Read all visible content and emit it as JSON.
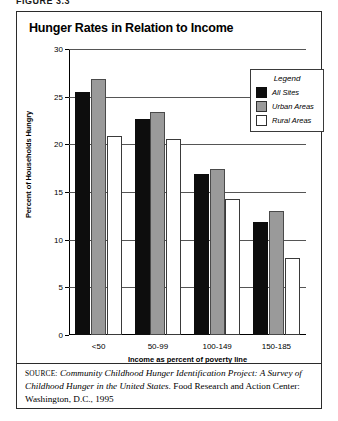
{
  "figure_caption": "FIGURE 3.3",
  "chart_title": "Hunger Rates in Relation to Income",
  "legend": {
    "title": "Legend",
    "items": [
      {
        "label": "All Sites",
        "color": "#0d0d0d",
        "key": "all_sites"
      },
      {
        "label": "Urban Areas",
        "color": "#9a9a9a",
        "key": "urban"
      },
      {
        "label": "Rural Areas",
        "color": "#ffffff",
        "key": "rural"
      }
    ]
  },
  "source": {
    "label": "SOURCE:",
    "italic_part": "Community Childhood Hunger Identification Project: A Survey of Childhood Hunger in the United States.",
    "rest": " Food Research and Action Center: Washington, D.C., 1995"
  },
  "chart_data": {
    "type": "bar",
    "title": "Hunger Rates in Relation to Income",
    "xlabel": "Income as percent of poverty line",
    "ylabel": "Percent of Households Hungry",
    "categories": [
      "<50",
      "50-99",
      "100-149",
      "150-185"
    ],
    "series": [
      {
        "name": "All Sites",
        "color": "#0d0d0d",
        "values": [
          25.5,
          22.7,
          16.9,
          11.9
        ]
      },
      {
        "name": "Urban Areas",
        "color": "#9a9a9a",
        "values": [
          26.9,
          23.4,
          17.4,
          13.0
        ]
      },
      {
        "name": "Rural Areas",
        "color": "#ffffff",
        "values": [
          20.9,
          20.6,
          14.3,
          8.1
        ]
      }
    ],
    "ylim": [
      0,
      30
    ],
    "yticks": [
      0,
      5,
      10,
      15,
      20,
      25,
      30
    ],
    "grid": true,
    "legend_position": "top-right"
  }
}
